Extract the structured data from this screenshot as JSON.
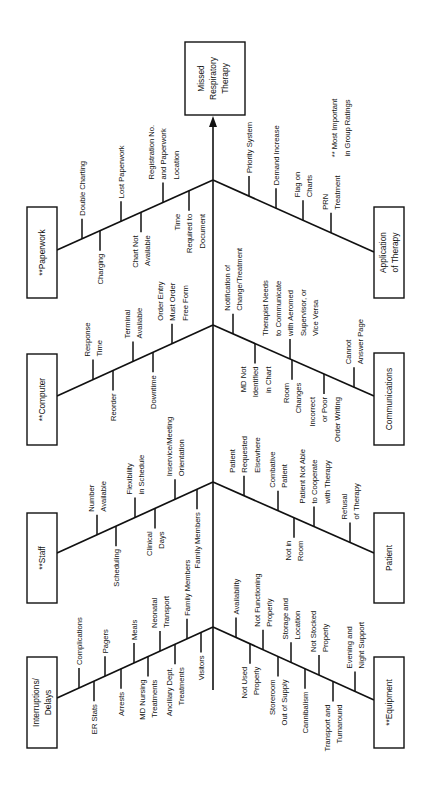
{
  "effect": {
    "lines": [
      "Missed",
      "Respiratory",
      "Therapy"
    ]
  },
  "note": {
    "lines": [
      "** Most Important",
      "in Group Ratings"
    ]
  },
  "categories": [
    {
      "id": "paperwork",
      "side": "left",
      "lines": [
        "**Paperwork"
      ],
      "causes": [
        {
          "lines": [
            "Double Charting"
          ],
          "dir": "up"
        },
        {
          "lines": [
            "Charging"
          ],
          "dir": "down"
        },
        {
          "lines": [
            "Lost Paperwork"
          ],
          "dir": "up"
        },
        {
          "lines": [
            "Chart Not",
            "Available"
          ],
          "dir": "down"
        },
        {
          "lines": [
            "Registration No.",
            "and Paperwork",
            "Location"
          ],
          "dir": "up"
        },
        {
          "lines": [
            "Time",
            "Required to",
            "Document"
          ],
          "dir": "down"
        }
      ]
    },
    {
      "id": "computer",
      "side": "left",
      "lines": [
        "**Computer"
      ],
      "causes": [
        {
          "lines": [
            "Response",
            "Time"
          ],
          "dir": "up"
        },
        {
          "lines": [
            "Reorder"
          ],
          "dir": "down"
        },
        {
          "lines": [
            "Terminal",
            "Available"
          ],
          "dir": "up"
        },
        {
          "lines": [
            "Downtime"
          ],
          "dir": "down"
        },
        {
          "lines": [
            "Order Entry",
            "Must Order",
            "Free Form"
          ],
          "dir": "up"
        }
      ]
    },
    {
      "id": "staff",
      "side": "left",
      "lines": [
        "**Staff"
      ],
      "causes": [
        {
          "lines": [
            "Number",
            "Available"
          ],
          "dir": "up"
        },
        {
          "lines": [
            "Scheduling"
          ],
          "dir": "down"
        },
        {
          "lines": [
            "Flexibility",
            "in Schedule"
          ],
          "dir": "up"
        },
        {
          "lines": [
            "Clinical",
            "Days"
          ],
          "dir": "down"
        },
        {
          "lines": [
            "Inservice/Meeting",
            "Orientation"
          ],
          "dir": "up"
        },
        {
          "lines": [
            "Family Members"
          ],
          "dir": "down"
        }
      ]
    },
    {
      "id": "interruptions",
      "side": "left",
      "lines": [
        "Interruptions/",
        "Delays"
      ],
      "causes": [
        {
          "lines": [
            "Complications"
          ],
          "dir": "up"
        },
        {
          "lines": [
            "ER Stats"
          ],
          "dir": "down"
        },
        {
          "lines": [
            "Pagers"
          ],
          "dir": "up"
        },
        {
          "lines": [
            "Arrests"
          ],
          "dir": "down"
        },
        {
          "lines": [
            "Meals"
          ],
          "dir": "up"
        },
        {
          "lines": [
            "MD Nursing",
            "Treatments"
          ],
          "dir": "down"
        },
        {
          "lines": [
            "Neonatal",
            "Transport"
          ],
          "dir": "up"
        },
        {
          "lines": [
            "Ancillary Dept.",
            "Treatments"
          ],
          "dir": "down"
        },
        {
          "lines": [
            "Family Members"
          ],
          "dir": "up"
        },
        {
          "lines": [
            "Visitors"
          ],
          "dir": "down"
        }
      ]
    },
    {
      "id": "application",
      "side": "right",
      "lines": [
        "Application",
        "of Therapy"
      ],
      "causes": [
        {
          "lines": [
            "Priority System"
          ],
          "dir": "up"
        },
        {
          "lines": [
            "Demand Increase"
          ],
          "dir": "up"
        },
        {
          "lines": [
            "Flag on",
            "Charts"
          ],
          "dir": "up"
        },
        {
          "lines": [
            "PRN",
            "Treatment"
          ],
          "dir": "up"
        }
      ]
    },
    {
      "id": "communications",
      "side": "right",
      "lines": [
        "Communications"
      ],
      "causes": [
        {
          "lines": [
            "Notification of",
            "Change/Treatment"
          ],
          "dir": "up"
        },
        {
          "lines": [
            "MD Not",
            "Identified",
            "in Chart"
          ],
          "dir": "down"
        },
        {
          "lines": [
            "Therapist Needs",
            "to Communicate",
            "with Aeromed",
            "Supervisor, or",
            "Vice Versa"
          ],
          "dir": "up"
        },
        {
          "lines": [
            "Room",
            "Changes"
          ],
          "dir": "down"
        },
        {
          "lines": [
            "Incorrect",
            "or Poor",
            "Order Writing"
          ],
          "dir": "down"
        },
        {
          "lines": [
            "Cannot",
            "Answer Page"
          ],
          "dir": "up"
        }
      ]
    },
    {
      "id": "patient",
      "side": "right",
      "lines": [
        "Patient"
      ],
      "causes": [
        {
          "lines": [
            "Patient",
            "Requested",
            "Elsewhere"
          ],
          "dir": "up"
        },
        {
          "lines": [
            "Combative",
            "Patient"
          ],
          "dir": "up"
        },
        {
          "lines": [
            "Not in",
            "Room"
          ],
          "dir": "down"
        },
        {
          "lines": [
            "Patient Not Able",
            "to Cooperate",
            "with Therapy"
          ],
          "dir": "up"
        },
        {
          "lines": [
            "Refusal",
            "of Therapy"
          ],
          "dir": "up"
        }
      ]
    },
    {
      "id": "equipment",
      "side": "right",
      "lines": [
        "**Equipment"
      ],
      "causes": [
        {
          "lines": [
            "Availability"
          ],
          "dir": "up"
        },
        {
          "lines": [
            "Not Used",
            "Properly"
          ],
          "dir": "down"
        },
        {
          "lines": [
            "Not Functioning",
            "Properly"
          ],
          "dir": "up"
        },
        {
          "lines": [
            "Storeroom",
            "Out of Supply"
          ],
          "dir": "down"
        },
        {
          "lines": [
            "Storage and",
            "Location"
          ],
          "dir": "up"
        },
        {
          "lines": [
            "Cannibalism"
          ],
          "dir": "down"
        },
        {
          "lines": [
            "Not Stocked",
            "Properly"
          ],
          "dir": "up"
        },
        {
          "lines": [
            "Transport and",
            "Turnaround"
          ],
          "dir": "down"
        },
        {
          "lines": [
            "Evening and",
            "Night Support"
          ],
          "dir": "up"
        }
      ]
    }
  ]
}
